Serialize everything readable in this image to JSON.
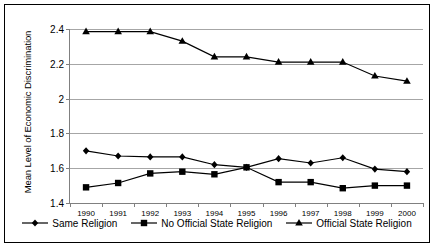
{
  "chart_data": {
    "type": "line",
    "title": "",
    "xlabel": "",
    "ylabel": "Mean Level of Economic Discrimination",
    "x": [
      1990,
      1991,
      1992,
      1993,
      1994,
      1995,
      1996,
      1997,
      1998,
      1999,
      2000
    ],
    "xtick_labels": [
      "1990",
      "1991",
      "1992",
      "1993",
      "1994",
      "1995",
      "1996",
      "1997",
      "1998",
      "1999",
      "2000"
    ],
    "ylim": [
      1.4,
      2.4
    ],
    "ytick_labels": [
      "1.4",
      "1.6",
      "1.8",
      "2",
      "2.2",
      "2.4"
    ],
    "yticks": [
      1.4,
      1.6,
      1.8,
      2.0,
      2.2,
      2.4
    ],
    "grid": true,
    "legend_position": "bottom",
    "series": [
      {
        "name": "Same Religion",
        "marker": "diamond",
        "color": "#000000",
        "values": [
          1.7,
          1.67,
          1.665,
          1.665,
          1.62,
          1.605,
          1.655,
          1.63,
          1.66,
          1.595,
          1.58
        ]
      },
      {
        "name": "No Official State Religion",
        "marker": "square",
        "color": "#000000",
        "values": [
          1.49,
          1.515,
          1.57,
          1.58,
          1.565,
          1.605,
          1.52,
          1.52,
          1.485,
          1.5,
          1.5
        ]
      },
      {
        "name": "Official State Religion",
        "marker": "triangle",
        "color": "#000000",
        "values": [
          2.385,
          2.385,
          2.385,
          2.33,
          2.24,
          2.24,
          2.21,
          2.21,
          2.21,
          2.13,
          2.1
        ]
      }
    ]
  }
}
